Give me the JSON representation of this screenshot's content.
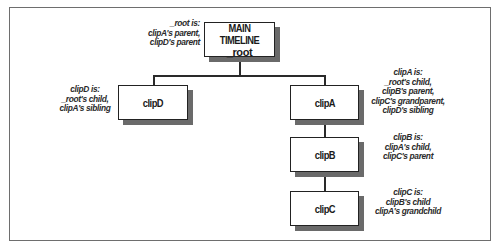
{
  "diagram": {
    "type": "tree",
    "nodes": [
      {
        "id": "root",
        "label": "MAIN TIMELINE",
        "sublabel": "_root",
        "parent": null
      },
      {
        "id": "clipD",
        "label": "clipD",
        "parent": "root"
      },
      {
        "id": "clipA",
        "label": "clipA",
        "parent": "root"
      },
      {
        "id": "clipB",
        "label": "clipB",
        "parent": "clipA"
      },
      {
        "id": "clipC",
        "label": "clipC",
        "parent": "clipB"
      }
    ],
    "edges": [
      {
        "from": "root",
        "to": "clipD"
      },
      {
        "from": "root",
        "to": "clipA"
      },
      {
        "from": "clipA",
        "to": "clipB"
      },
      {
        "from": "clipB",
        "to": "clipC"
      }
    ],
    "annotations": {
      "root": [
        "_root is:",
        "clipA's parent,",
        "clipD's parent"
      ],
      "clipD": [
        "clipD is:",
        "_root's child,",
        "clipA's sibling"
      ],
      "clipA": [
        "clipA is:",
        "_root's child,",
        "clipB's parent,",
        "clipC's grandparent,",
        "clipD's sibling"
      ],
      "clipB": [
        "clipB is:",
        "clipA's child,",
        "clipC's parent"
      ],
      "clipC": [
        "clipC is:",
        "clipB's child",
        "clipA's grandchild"
      ]
    }
  },
  "colors": {
    "box_border": "#222222",
    "box_shadow": "#6a6a6a",
    "frame_border": "#6e6e6e",
    "text": "#1a1a1a"
  }
}
